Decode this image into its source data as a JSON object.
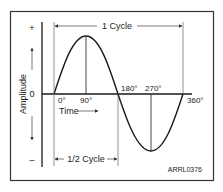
{
  "diagram": {
    "y_axis": {
      "label": "Amplitude",
      "plus": "+",
      "zero": "0",
      "minus": "–"
    },
    "x_axis": {
      "time_label": "Time",
      "ticks": [
        "0°",
        "90°",
        "180°",
        "270°",
        "360°"
      ]
    },
    "annotations": {
      "full_cycle": "1 Cycle",
      "half_cycle": "1/2 Cycle"
    },
    "credit": "ARRL0376",
    "colors": {
      "line": "#1a1a1a",
      "frame": "#333333",
      "background": "#ffffff"
    }
  }
}
